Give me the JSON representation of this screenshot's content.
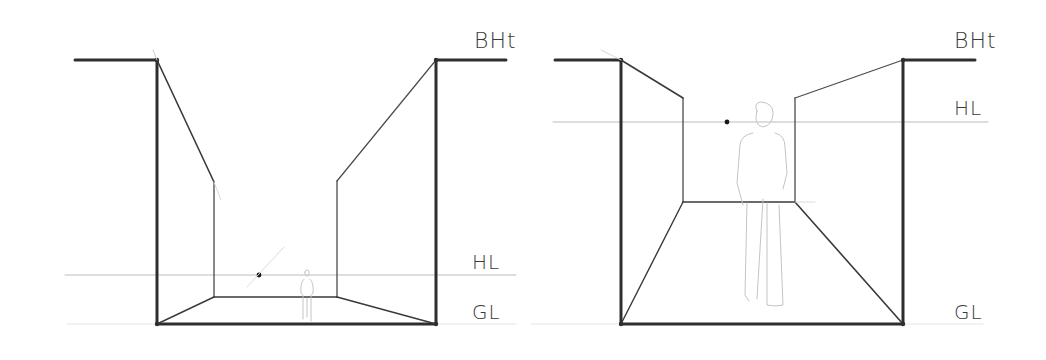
{
  "diagrams": [
    {
      "id": "left",
      "title": "Low horizon (worm's-eye) one-point perspective",
      "labels": {
        "bht": "BHt",
        "hl": "HL",
        "gl": "GL"
      },
      "label_positions": {
        "bht": [
          474,
          28
        ],
        "hl": [
          472,
          250
        ],
        "gl": [
          472,
          300
        ]
      },
      "building_height_line": {
        "left": [
          [
            75,
            60
          ],
          [
            157,
            60
          ]
        ],
        "right": [
          [
            436,
            60
          ],
          [
            506,
            60
          ]
        ]
      },
      "outer_frame": {
        "left_x": 157,
        "right_x": 436,
        "top_y": 60,
        "bottom_y": 324
      },
      "inner_frame": {
        "left_x": 214,
        "right_x": 337,
        "top_left_y": 182,
        "top_right_y": 181,
        "bottom_y": 297
      },
      "horizon_line": {
        "y": 275,
        "x1": 65,
        "x2": 516
      },
      "vanishing_point": [
        259,
        275
      ],
      "figure": {
        "type": "small-person",
        "x": 307,
        "top": 270,
        "bottom": 321
      }
    },
    {
      "id": "right",
      "title": "High horizon (eye-level) one-point perspective",
      "labels": {
        "bht": "BHt",
        "hl": "HL",
        "gl": "GL"
      },
      "label_positions": {
        "bht": [
          954,
          28
        ],
        "hl": [
          954,
          96
        ],
        "gl": [
          954,
          300
        ]
      },
      "building_height_line": {
        "left": [
          [
            555,
            60
          ],
          [
            621,
            60
          ]
        ],
        "right": [
          [
            903,
            60
          ],
          [
            975,
            60
          ]
        ]
      },
      "outer_frame": {
        "left_x": 621,
        "right_x": 903,
        "top_y": 60,
        "bottom_y": 324
      },
      "inner_frame": {
        "left_x": 683,
        "right_x": 795,
        "top_left_y": 98,
        "top_right_y": 98,
        "bottom_y": 202
      },
      "horizon_line": {
        "y": 122,
        "x1": 553,
        "x2": 988
      },
      "vanishing_point": [
        727,
        122
      ],
      "figure": {
        "type": "large-person",
        "x": 765,
        "top": 103,
        "bottom": 305
      }
    }
  ],
  "colors": {
    "ink": "#2e2e2e",
    "faint": "#bdbdbd",
    "figure": "#c4c4c4",
    "paper": "#ffffff"
  }
}
